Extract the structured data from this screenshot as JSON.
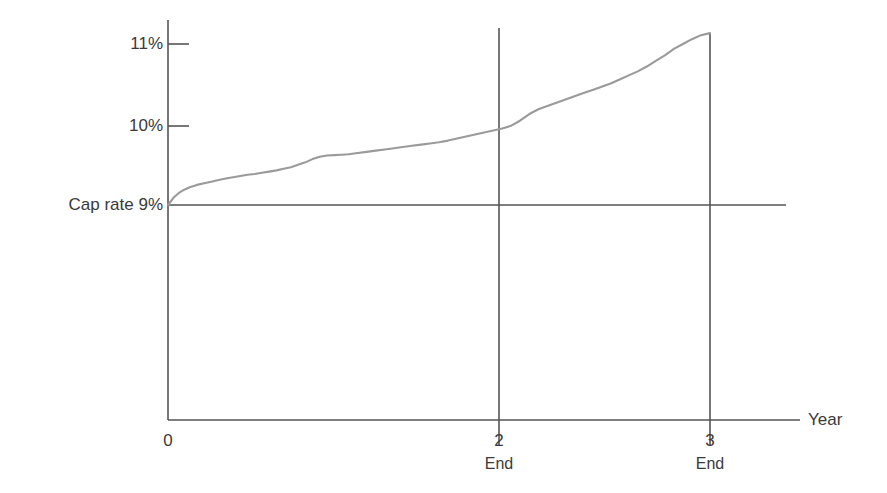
{
  "chart_data": {
    "type": "line",
    "title": "",
    "subtitle": "",
    "xlabel": "Year",
    "ylabel": "Cap rate",
    "grid": false,
    "legend": null,
    "xlim": [
      0,
      3.45
    ],
    "ylim": [
      7.56,
      11.45
    ],
    "x_ticks": [
      {
        "value": 0,
        "label": "0",
        "sublabel": ""
      },
      {
        "value": 2,
        "label": "2",
        "sublabel": "End"
      },
      {
        "value": 3,
        "label": "3",
        "sublabel": "End"
      }
    ],
    "y_ticks": [
      {
        "value": 9,
        "label": "Cap rate 9%"
      },
      {
        "value": 10,
        "label": "10%"
      },
      {
        "value": 11,
        "label": "11%"
      }
    ],
    "reference_lines": [
      {
        "orientation": "horizontal",
        "value": 9,
        "label": "Cap rate 9%",
        "color": "#555555"
      },
      {
        "orientation": "vertical",
        "value": 2,
        "label": "2 End",
        "color": "#555555"
      },
      {
        "orientation": "vertical",
        "value": 3,
        "label": "3 End",
        "color": "#555555"
      }
    ],
    "series": [
      {
        "name": "Cumulative yield",
        "color": "#9a9a9a",
        "x": [
          0.0,
          0.03,
          0.06,
          0.09,
          0.12,
          0.16,
          0.2,
          0.24,
          0.28,
          0.32,
          0.36,
          0.4,
          0.44,
          0.48,
          0.52,
          0.56,
          0.6,
          0.64,
          0.68,
          0.72,
          0.76,
          0.8,
          0.84,
          0.88,
          0.92,
          0.96,
          1.0,
          1.05,
          1.1,
          1.15,
          1.2,
          1.25,
          1.3,
          1.35,
          1.4,
          1.45,
          1.5,
          1.55,
          1.6,
          1.65,
          1.7,
          1.75,
          1.8,
          1.85,
          1.9,
          1.95,
          2.0,
          2.05,
          2.1,
          2.15,
          2.2,
          2.25,
          2.3,
          2.35,
          2.4,
          2.45,
          2.5,
          2.55,
          2.6,
          2.65,
          2.7,
          2.75,
          2.8,
          2.85,
          2.9,
          2.95,
          3.0
        ],
        "y": [
          9.0,
          9.09,
          9.15,
          9.19,
          9.22,
          9.25,
          9.27,
          9.29,
          9.31,
          9.33,
          9.345,
          9.36,
          9.375,
          9.385,
          9.4,
          9.415,
          9.43,
          9.45,
          9.47,
          9.5,
          9.53,
          9.57,
          9.6,
          9.615,
          9.62,
          9.625,
          9.63,
          9.645,
          9.66,
          9.675,
          9.69,
          9.705,
          9.72,
          9.735,
          9.75,
          9.765,
          9.78,
          9.8,
          9.825,
          9.85,
          9.875,
          9.9,
          9.925,
          9.95,
          9.985,
          10.05,
          10.13,
          10.19,
          10.23,
          10.27,
          10.31,
          10.35,
          10.39,
          10.43,
          10.47,
          10.51,
          10.56,
          10.61,
          10.66,
          10.72,
          10.79,
          10.86,
          10.94,
          11.0,
          11.06,
          11.11,
          11.135
        ]
      }
    ],
    "annotations": []
  },
  "axes": {
    "y_axis_label_0": "11%",
    "y_axis_label_1": "10%",
    "y_axis_label_2": "Cap rate 9%",
    "x_axis_label_0": "0",
    "x_axis_label_1": "2",
    "x_axis_sub_1": "End",
    "x_axis_label_2": "3",
    "x_axis_sub_2": "End",
    "x_axis_title": "Year"
  },
  "colors": {
    "axis": "#555555",
    "series": "#9a9a9a",
    "text": "#3a3a3a",
    "background": "#ffffff"
  }
}
